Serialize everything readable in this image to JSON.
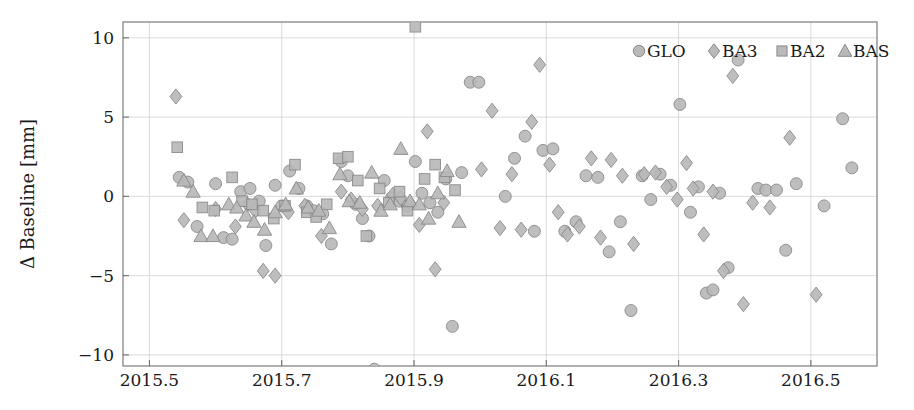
{
  "chart_data": {
    "type": "scatter",
    "title": "",
    "xlabel": "",
    "ylabel": "Δ Baseline [mm]",
    "xlim": [
      2015.46,
      2016.6
    ],
    "ylim": [
      -10.7,
      11.0
    ],
    "xticks": [
      2015.5,
      2015.7,
      2015.9,
      2016.1,
      2016.3,
      2016.5
    ],
    "xtick_labels": [
      "2015.5",
      "2015.7",
      "2015.9",
      "2016.1",
      "2016.3",
      "2016.5"
    ],
    "yticks": [
      10,
      5,
      0,
      -5,
      -10
    ],
    "ytick_labels": [
      "10",
      "5",
      "0",
      "−15",
      "−10"
    ],
    "ytick_labels_display": [
      "10",
      "5",
      "0",
      "−5",
      "−10"
    ],
    "grid": true,
    "legend_position": "top-right-inside",
    "marker_fill": "#b9b9b9",
    "marker_stroke": "#8a8a8a",
    "series": [
      {
        "name": "GLO",
        "marker": "circle",
        "points": [
          [
            2015.545,
            1.2
          ],
          [
            2015.558,
            0.9
          ],
          [
            2015.572,
            -1.9
          ],
          [
            2015.6,
            0.8
          ],
          [
            2015.612,
            -2.6
          ],
          [
            2015.625,
            -2.7
          ],
          [
            2015.638,
            0.3
          ],
          [
            2015.652,
            0.5
          ],
          [
            2015.666,
            -0.3
          ],
          [
            2015.676,
            -3.1
          ],
          [
            2015.69,
            0.7
          ],
          [
            2015.7,
            -0.6
          ],
          [
            2015.712,
            1.6
          ],
          [
            2015.726,
            0.5
          ],
          [
            2015.738,
            -0.6
          ],
          [
            2015.748,
            -0.9
          ],
          [
            2015.762,
            -1.1
          ],
          [
            2015.775,
            -3.0
          ],
          [
            2015.79,
            2.2
          ],
          [
            2015.8,
            1.3
          ],
          [
            2015.812,
            -0.5
          ],
          [
            2015.822,
            -1.4
          ],
          [
            2015.832,
            -2.5
          ],
          [
            2015.84,
            -10.9
          ],
          [
            2015.855,
            1.0
          ],
          [
            2015.866,
            -0.1
          ],
          [
            2015.878,
            -0.3
          ],
          [
            2015.89,
            -0.6
          ],
          [
            2015.902,
            2.2
          ],
          [
            2015.912,
            0.2
          ],
          [
            2015.924,
            -0.4
          ],
          [
            2015.936,
            -1.0
          ],
          [
            2015.948,
            1.1
          ],
          [
            2015.958,
            -8.2
          ],
          [
            2015.972,
            1.5
          ],
          [
            2015.985,
            7.2
          ],
          [
            2015.998,
            7.2
          ],
          [
            2016.038,
            0.0
          ],
          [
            2016.052,
            2.4
          ],
          [
            2016.068,
            3.8
          ],
          [
            2016.082,
            -2.2
          ],
          [
            2016.095,
            2.9
          ],
          [
            2016.11,
            3.0
          ],
          [
            2016.128,
            -2.2
          ],
          [
            2016.145,
            -1.6
          ],
          [
            2016.16,
            1.3
          ],
          [
            2016.178,
            1.2
          ],
          [
            2016.195,
            -3.5
          ],
          [
            2016.212,
            -1.6
          ],
          [
            2016.228,
            -7.2
          ],
          [
            2016.245,
            1.3
          ],
          [
            2016.258,
            -0.2
          ],
          [
            2016.272,
            1.4
          ],
          [
            2016.288,
            0.7
          ],
          [
            2016.302,
            5.8
          ],
          [
            2016.318,
            -1.0
          ],
          [
            2016.33,
            0.6
          ],
          [
            2016.342,
            -6.1
          ],
          [
            2016.352,
            -5.9
          ],
          [
            2016.362,
            0.2
          ],
          [
            2016.375,
            -4.5
          ],
          [
            2016.39,
            8.6
          ],
          [
            2016.42,
            0.5
          ],
          [
            2016.432,
            0.4
          ],
          [
            2016.448,
            0.4
          ],
          [
            2016.462,
            -3.4
          ],
          [
            2016.478,
            0.8
          ],
          [
            2016.52,
            -0.6
          ],
          [
            2016.548,
            4.9
          ],
          [
            2016.562,
            1.8
          ]
        ]
      },
      {
        "name": "BA3",
        "marker": "diamond",
        "points": [
          [
            2015.54,
            6.3
          ],
          [
            2015.552,
            -1.5
          ],
          [
            2015.6,
            -0.8
          ],
          [
            2015.63,
            -1.9
          ],
          [
            2015.648,
            -0.5
          ],
          [
            2015.66,
            -0.9
          ],
          [
            2015.672,
            -4.7
          ],
          [
            2015.69,
            -5.0
          ],
          [
            2015.71,
            -1.0
          ],
          [
            2015.735,
            -0.6
          ],
          [
            2015.76,
            -2.5
          ],
          [
            2015.79,
            0.3
          ],
          [
            2015.805,
            -0.2
          ],
          [
            2015.822,
            -0.8
          ],
          [
            2015.845,
            -0.6
          ],
          [
            2015.868,
            0.1
          ],
          [
            2015.88,
            -0.1
          ],
          [
            2015.895,
            -0.5
          ],
          [
            2015.908,
            -1.8
          ],
          [
            2015.92,
            4.1
          ],
          [
            2015.932,
            -4.6
          ],
          [
            2015.945,
            -0.4
          ],
          [
            2016.002,
            1.7
          ],
          [
            2016.018,
            5.4
          ],
          [
            2016.03,
            -2.0
          ],
          [
            2016.048,
            1.4
          ],
          [
            2016.062,
            -2.1
          ],
          [
            2016.078,
            4.7
          ],
          [
            2016.09,
            8.3
          ],
          [
            2016.105,
            2.0
          ],
          [
            2016.118,
            -1.0
          ],
          [
            2016.132,
            -2.4
          ],
          [
            2016.15,
            -1.9
          ],
          [
            2016.168,
            2.4
          ],
          [
            2016.182,
            -2.6
          ],
          [
            2016.198,
            2.3
          ],
          [
            2016.215,
            1.3
          ],
          [
            2016.232,
            -3.0
          ],
          [
            2016.248,
            1.4
          ],
          [
            2016.265,
            1.5
          ],
          [
            2016.282,
            0.6
          ],
          [
            2016.298,
            -0.2
          ],
          [
            2016.312,
            2.1
          ],
          [
            2016.322,
            0.5
          ],
          [
            2016.338,
            -2.4
          ],
          [
            2016.352,
            0.3
          ],
          [
            2016.368,
            -4.7
          ],
          [
            2016.382,
            7.6
          ],
          [
            2016.398,
            -6.8
          ],
          [
            2016.412,
            -0.4
          ],
          [
            2016.438,
            -0.7
          ],
          [
            2016.468,
            3.7
          ],
          [
            2016.508,
            -6.2
          ]
        ]
      },
      {
        "name": "BA2",
        "marker": "square",
        "points": [
          [
            2015.542,
            3.1
          ],
          [
            2015.58,
            -0.7
          ],
          [
            2015.598,
            -0.9
          ],
          [
            2015.625,
            1.2
          ],
          [
            2015.64,
            -0.3
          ],
          [
            2015.655,
            -0.5
          ],
          [
            2015.672,
            -0.9
          ],
          [
            2015.688,
            -1.4
          ],
          [
            2015.705,
            -0.6
          ],
          [
            2015.72,
            2.0
          ],
          [
            2015.738,
            -1.0
          ],
          [
            2015.752,
            -1.3
          ],
          [
            2015.768,
            -0.5
          ],
          [
            2015.786,
            2.4
          ],
          [
            2015.8,
            2.5
          ],
          [
            2015.815,
            1.0
          ],
          [
            2015.828,
            -2.5
          ],
          [
            2015.848,
            0.5
          ],
          [
            2015.862,
            -0.4
          ],
          [
            2015.878,
            0.3
          ],
          [
            2015.89,
            -0.9
          ],
          [
            2015.902,
            10.7
          ],
          [
            2015.916,
            1.1
          ],
          [
            2015.932,
            2.0
          ],
          [
            2015.946,
            1.2
          ],
          [
            2015.962,
            0.4
          ]
        ]
      },
      {
        "name": "BAS",
        "marker": "triangle",
        "points": [
          [
            2015.552,
            1.0
          ],
          [
            2015.566,
            0.3
          ],
          [
            2015.578,
            -2.5
          ],
          [
            2015.596,
            -2.5
          ],
          [
            2015.62,
            -0.5
          ],
          [
            2015.632,
            -0.7
          ],
          [
            2015.646,
            -1.2
          ],
          [
            2015.658,
            -1.6
          ],
          [
            2015.674,
            -2.1
          ],
          [
            2015.69,
            -1.0
          ],
          [
            2015.706,
            -0.5
          ],
          [
            2015.722,
            0.5
          ],
          [
            2015.74,
            -0.7
          ],
          [
            2015.756,
            -0.9
          ],
          [
            2015.772,
            -2.0
          ],
          [
            2015.788,
            1.4
          ],
          [
            2015.802,
            -0.3
          ],
          [
            2015.818,
            -0.4
          ],
          [
            2015.836,
            1.5
          ],
          [
            2015.85,
            -0.9
          ],
          [
            2015.864,
            -0.5
          ],
          [
            2015.88,
            3.0
          ],
          [
            2015.894,
            -0.3
          ],
          [
            2015.908,
            -0.5
          ],
          [
            2015.922,
            -1.4
          ],
          [
            2015.936,
            0.2
          ],
          [
            2015.95,
            1.6
          ],
          [
            2015.968,
            -1.6
          ]
        ]
      }
    ]
  },
  "legend": {
    "entries": [
      {
        "label": "GLO",
        "marker": "circle"
      },
      {
        "label": "BA3",
        "marker": "diamond"
      },
      {
        "label": "BA2",
        "marker": "square"
      },
      {
        "label": "BAS",
        "marker": "triangle"
      }
    ]
  }
}
